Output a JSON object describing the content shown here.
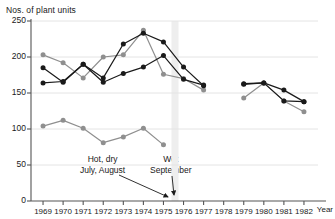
{
  "chart_data": {
    "type": "line",
    "title": "",
    "xlabel": "Year",
    "ylabel": "Nos. of plant units",
    "x": [
      1969,
      1970,
      1971,
      1972,
      1973,
      1974,
      1975,
      1976,
      1977,
      1978,
      1979,
      1980,
      1981,
      1982
    ],
    "xlim": [
      1968.4,
      1982.7
    ],
    "ylim": [
      0,
      250
    ],
    "yticks": [
      0,
      50,
      100,
      150,
      200,
      250
    ],
    "xticks": [
      1969,
      1970,
      1971,
      1972,
      1973,
      1974,
      1975,
      1976,
      1977,
      1978,
      1979,
      1980,
      1981,
      1982
    ],
    "grid": true,
    "legend": "none",
    "series": [
      {
        "name": "dark-series-upper",
        "color": "#1a1a1a",
        "points": [
          {
            "x": 1969,
            "y": 185
          },
          {
            "x": 1970,
            "y": 165
          },
          {
            "x": 1971,
            "y": 190
          },
          {
            "x": 1972,
            "y": 171
          },
          {
            "x": 1973,
            "y": 218
          },
          {
            "x": 1974,
            "y": 233
          },
          {
            "x": 1975,
            "y": 221
          },
          {
            "x": 1976,
            "y": 186
          },
          {
            "x": 1977,
            "y": 160
          },
          {
            "x": 1979,
            "y": 163
          },
          {
            "x": 1980,
            "y": 164
          },
          {
            "x": 1981,
            "y": 154
          },
          {
            "x": 1982,
            "y": 138
          }
        ]
      },
      {
        "name": "dark-series-lower",
        "color": "#1a1a1a",
        "points": [
          {
            "x": 1969,
            "y": 164
          },
          {
            "x": 1970,
            "y": 166
          },
          {
            "x": 1971,
            "y": 190
          },
          {
            "x": 1972,
            "y": 165
          },
          {
            "x": 1973,
            "y": 177
          },
          {
            "x": 1974,
            "y": 186
          },
          {
            "x": 1975,
            "y": 202
          },
          {
            "x": 1976,
            "y": 169
          },
          {
            "x": 1977,
            "y": 161
          },
          {
            "x": 1979,
            "y": 162
          },
          {
            "x": 1980,
            "y": 164
          },
          {
            "x": 1981,
            "y": 139
          },
          {
            "x": 1982,
            "y": 138
          }
        ]
      },
      {
        "name": "gray-series-upper",
        "color": "#8f8f8f",
        "points": [
          {
            "x": 1969,
            "y": 203
          },
          {
            "x": 1970,
            "y": 192
          },
          {
            "x": 1971,
            "y": 171
          },
          {
            "x": 1972,
            "y": 200
          },
          {
            "x": 1973,
            "y": 203
          },
          {
            "x": 1974,
            "y": 237
          },
          {
            "x": 1975,
            "y": 176
          },
          {
            "x": 1976,
            "y": 170
          },
          {
            "x": 1977,
            "y": 154
          },
          {
            "x": 1979,
            "y": 143
          },
          {
            "x": 1980,
            "y": 164
          },
          {
            "x": 1981,
            "y": 139
          },
          {
            "x": 1982,
            "y": 124
          }
        ]
      },
      {
        "name": "gray-series-lower",
        "color": "#8f8f8f",
        "points": [
          {
            "x": 1969,
            "y": 104
          },
          {
            "x": 1970,
            "y": 112
          },
          {
            "x": 1971,
            "y": 101
          },
          {
            "x": 1972,
            "y": 81
          },
          {
            "x": 1973,
            "y": 89
          },
          {
            "x": 1974,
            "y": 101
          },
          {
            "x": 1975,
            "y": 78
          }
        ]
      }
    ],
    "annotations": [
      {
        "name": "hot-dry-annotation",
        "line1": "Hot, dry",
        "line2": "July, August"
      },
      {
        "name": "wet-september-annotation",
        "line1": "Wet",
        "line2": "September"
      }
    ],
    "highlight_band": {
      "from": 1975.4,
      "to": 1975.75,
      "color": "#eeeeee"
    },
    "colors": {
      "dark": "#1a1a1a",
      "gray": "#8f8f8f",
      "grid": "#e4e4e4",
      "axis": "#555555"
    }
  }
}
